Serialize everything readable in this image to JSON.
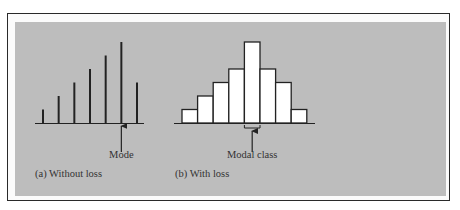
{
  "figure": {
    "panel_a_caption": "(a) Without loss",
    "panel_b_caption": "(b) With loss",
    "mode_label": "Mode",
    "modal_class_label": "Modal class",
    "colors": {
      "panel_bg": "#bdbdbd",
      "ink": "#222222",
      "bar_fill": "#ffffff"
    }
  },
  "chart_data": [
    {
      "type": "bar",
      "style": "spike",
      "title": "(a) Without loss",
      "categories": [
        "1",
        "2",
        "3",
        "4",
        "5",
        "6",
        "7"
      ],
      "values": [
        1,
        2,
        3,
        4,
        5,
        6,
        3
      ],
      "annotation": {
        "text": "Mode",
        "category_index": 5
      },
      "xlabel": "",
      "ylabel": "",
      "grid": false
    },
    {
      "type": "bar",
      "style": "histogram",
      "title": "(b) With loss",
      "categories": [
        "1",
        "2",
        "3",
        "4",
        "5",
        "6",
        "7",
        "8"
      ],
      "values": [
        1,
        2,
        3,
        4,
        6,
        4,
        3,
        1
      ],
      "annotation": {
        "text": "Modal class",
        "category_index": 4
      },
      "xlabel": "",
      "ylabel": "",
      "grid": false
    }
  ]
}
